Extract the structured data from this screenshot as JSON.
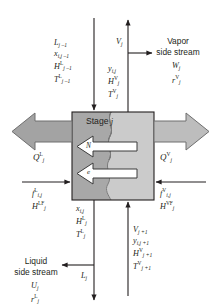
{
  "figure": {
    "stage_label_text": "Stage",
    "stage_label_index": "j",
    "interface_arrow_top": "N",
    "interface_arrow_bottom": "e",
    "colors": {
      "liquid_zone": "#a8a8a8",
      "vapor_zone": "#c9c9c9",
      "heat_arrow": "#a3a3a3",
      "line": "#231f20",
      "background": "#ffffff"
    }
  },
  "streams": {
    "liquid_in_top": {
      "name": "liquid-inlet-from-stage-above",
      "direction": "down",
      "labels": [
        "L j-1",
        "x i,j-1",
        "H L j-1",
        "T L j-1"
      ]
    },
    "vapor_out_top": {
      "name": "vapor-outlet-to-stage-above",
      "direction": "up",
      "labels": [
        "V j"
      ]
    },
    "vapor_side_stream": {
      "name": "vapor-side-stream",
      "heading_line1": "Vapor",
      "heading_line2": "side stream",
      "labels": [
        "W j",
        "r V j"
      ]
    },
    "vapor_leaving_props": {
      "name": "vapor-leaving-properties",
      "labels": [
        "y i,j",
        "H V j",
        "T V j"
      ]
    },
    "heat_liquid": {
      "name": "liquid-phase-heat-duty",
      "label": "Q L j",
      "direction": "left"
    },
    "heat_vapor": {
      "name": "vapor-phase-heat-duty",
      "label": "Q V j",
      "direction": "right"
    },
    "feed_liquid": {
      "name": "liquid-feed",
      "direction": "right",
      "labels": [
        "f L i,j",
        "H LF j"
      ]
    },
    "feed_vapor": {
      "name": "vapor-feed",
      "direction": "left",
      "labels": [
        "f V i,j",
        "H VF j"
      ]
    },
    "liquid_leaving_props": {
      "name": "liquid-leaving-properties",
      "labels": [
        "x i,j",
        "H L j",
        "T L j"
      ]
    },
    "vapor_in_bottom": {
      "name": "vapor-inlet-from-stage-below",
      "direction": "up",
      "labels": [
        "V j+1",
        "y i,j+1",
        "H V j+1",
        "T V j+1"
      ]
    },
    "liquid_side_stream": {
      "name": "liquid-side-stream",
      "heading_line1": "Liquid",
      "heading_line2": "side stream",
      "labels": [
        "U j",
        "r L j"
      ]
    },
    "liquid_out_bottom": {
      "name": "liquid-outlet-to-stage-below",
      "direction": "down",
      "labels": [
        "L j"
      ]
    }
  },
  "text": {
    "L_jm1": "L",
    "L_jm1_sub": "j –1",
    "x_ijm1": "x",
    "x_ijm1_sub": "i,j –1",
    "H_L_jm1": "H",
    "H_L_jm1_sup": "L",
    "H_L_jm1_sub": "j –1",
    "T_L_jm1": "T",
    "T_L_jm1_sup": "L",
    "T_L_jm1_sub": "j –1",
    "V_j": "V",
    "V_j_sub": "j",
    "vapor_line1": "Vapor",
    "vapor_line2": "side stream",
    "W_j": "W",
    "W_j_sub": "j",
    "r_V_j": "r",
    "r_V_j_sup": "V",
    "r_V_j_sub": "j",
    "y_ij": "y",
    "y_ij_sub": "i,j",
    "H_V_j": "H",
    "H_V_j_sup": "V",
    "H_V_j_sub": "j",
    "T_V_j": "T",
    "T_V_j_sup": "V",
    "T_V_j_sub": "j",
    "Q_L_j": "Q",
    "Q_L_j_sup": "L",
    "Q_L_j_sub": "j",
    "Q_V_j": "Q",
    "Q_V_j_sup": "V",
    "Q_V_j_sub": "j",
    "stage": "Stage",
    "stage_j": "j",
    "arrow_N": "N",
    "arrow_e": "e",
    "f_L_ij": "f",
    "f_L_ij_sup": "L",
    "f_L_ij_sub": "i,j",
    "H_LF_j": "H",
    "H_LF_j_sup": "LF",
    "H_LF_j_sub": "j",
    "f_V_ij": "f",
    "f_V_ij_sup": "V",
    "f_V_ij_sub": "i,j",
    "H_VF_j": "H",
    "H_VF_j_sup": "VF",
    "H_VF_j_sub": "j",
    "x_ij": "x",
    "x_ij_sub": "i,j",
    "H_L_j": "H",
    "H_L_j_sup": "L",
    "H_L_j_sub": "j",
    "T_L_j": "T",
    "T_L_j_sup": "L",
    "T_L_j_sub": "j",
    "V_jp1": "V",
    "V_jp1_sub": "j +1",
    "y_ijp1": "y",
    "y_ijp1_sub": "i,j +1",
    "H_V_jp1": "H",
    "H_V_jp1_sup": "V",
    "H_V_jp1_sub": "j +1",
    "T_V_jp1": "T",
    "T_V_jp1_sup": "V",
    "T_V_jp1_sub": "j +1",
    "liquid_line1": "Liquid",
    "liquid_line2": "side stream",
    "U_j": "U",
    "U_j_sub": "j",
    "r_L_j": "r",
    "r_L_j_sup": "L",
    "r_L_j_sub": "j",
    "L_j": "L",
    "L_j_sub": "j"
  }
}
